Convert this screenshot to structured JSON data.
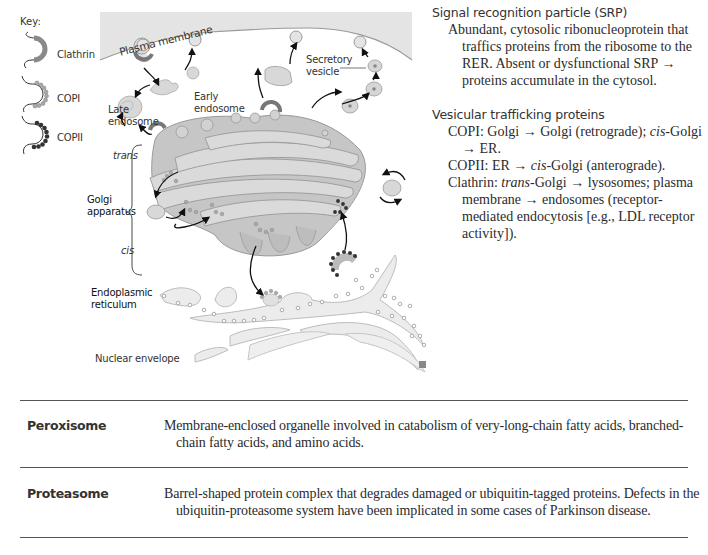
{
  "figure": {
    "key": {
      "title": "Key:",
      "items": [
        {
          "label": "Clathrin",
          "color": "#8a8a8a"
        },
        {
          "label": "COPI",
          "color": "#9c9c9c"
        },
        {
          "label": "COPII",
          "color": "#333333"
        }
      ]
    },
    "labels": {
      "plasma_membrane": "Plasma membrane",
      "secretory_vesicle_1": "Secretory",
      "secretory_vesicle_2": "vesicle",
      "early_endosome_1": "Early",
      "early_endosome_2": "endosome",
      "late_endosome_1": "Late",
      "late_endosome_2": "endosome",
      "trans": "trans",
      "golgi_1": "Golgi",
      "golgi_2": "apparatus",
      "cis": "cis",
      "er_1": "Endoplasmic",
      "er_2": "reticulum",
      "nuclear_envelope": "Nuclear envelope"
    },
    "colors": {
      "cytoplasm": "#e6e6e6",
      "golgi_light": "#d9d9d9",
      "golgi_mid": "#bdbdbd",
      "golgi_dark": "#a8a8a8",
      "er": "#ececec",
      "outline": "#9a9a9a"
    }
  },
  "side_notes": {
    "srp": {
      "heading": "Signal recognition particle (SRP)",
      "body": "Abundant, cytosolic ribonucleoprotein that traffics proteins from the ribosome to the RER. Absent or dysfunctional SRP → proteins accumulate in the cytosol."
    },
    "vesicular": {
      "heading": "Vesicular trafficking proteins",
      "items": [
        {
          "pre": "COPI: Golgi → Golgi (retrograde); ",
          "em": "cis",
          "post": "-Golgi → ER."
        },
        {
          "pre": "COPII: ER → ",
          "em": "cis",
          "post": "-Golgi (anterograde)."
        },
        {
          "pre": "Clathrin: ",
          "em": "trans",
          "post": "-Golgi → lysosomes; plasma membrane → endosomes (receptor-mediated endocytosis [e.g., LDL receptor activity])."
        }
      ]
    }
  },
  "table": {
    "rows": [
      {
        "term": "Peroxisome",
        "definition": "Membrane-enclosed organelle involved in catabolism of very-long-chain fatty acids, branched-chain fatty acids, and amino acids."
      },
      {
        "term": "Proteasome",
        "definition": "Barrel-shaped protein complex that degrades damaged or ubiquitin-tagged proteins. Defects in the ubiquitin-proteasome system have been implicated in some cases of Parkinson disease."
      }
    ]
  }
}
